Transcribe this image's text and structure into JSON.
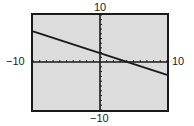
{
  "chart_data": {
    "type": "line",
    "title": "",
    "xlabel": "",
    "ylabel": "",
    "xlim": [
      -10,
      10
    ],
    "ylim": [
      -10,
      10
    ],
    "xscale_tick": 1,
    "yscale_tick": 1,
    "grid": false,
    "tick_labels": {
      "x_min": "−10",
      "x_max": "10",
      "y_min": "−10",
      "y_max": "10"
    },
    "series": [
      {
        "name": "line",
        "x": [
          -10,
          10
        ],
        "y": [
          6.5,
          -2.7
        ],
        "approx_equation": "y ≈ -0.46x + 1.9",
        "color": "#1a1a1a"
      }
    ],
    "background": "#dcdcdc",
    "frame_color": "#1a1a1a"
  }
}
